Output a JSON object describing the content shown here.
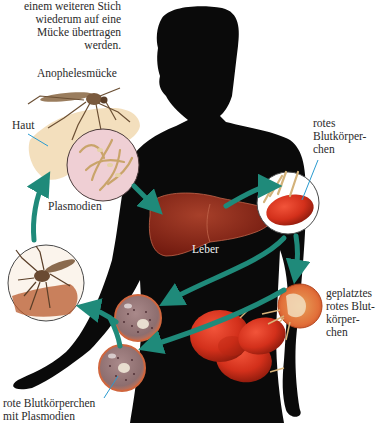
{
  "diagram": {
    "intro_text": [
      "einem weiteren Stich",
      "wiederum auf eine",
      "Mücke übertragen",
      "werden."
    ],
    "labels": {
      "mosquito": "Anophelesmücke",
      "skin": "Haut",
      "sporozoites": "Plasmodien",
      "liver": "Leber",
      "rbc": [
        "rotes",
        "Blutkörper-",
        "chen"
      ],
      "burst_rbc": [
        "geplatztes",
        "rotes Blut-",
        "körper-",
        "chen"
      ],
      "infected_rbc": [
        "rote Blutkörperchen",
        "mit Plasmodien"
      ]
    },
    "colors": {
      "silhouette": "#0a0a0a",
      "arrow": "#1f8a7a",
      "liver": "#8a2416",
      "rbc": "#d6321c",
      "infected_rbc": "#9c7a78",
      "inset_pink": "#efcfd4",
      "skin": "#f2dcb6",
      "pointer": "#2a9bd0"
    },
    "nodes": [
      {
        "id": "mosquito-bite",
        "label": "Anophelesmücke"
      },
      {
        "id": "plasmodien",
        "label": "Plasmodien"
      },
      {
        "id": "leber",
        "label": "Leber"
      },
      {
        "id": "rotes-blutkoerperchen",
        "label": "rotes Blutkörperchen"
      },
      {
        "id": "geplatztes-blutkoerperchen",
        "label": "geplatztes rotes Blutkörperchen"
      },
      {
        "id": "infizierte-blutkoerperchen",
        "label": "rote Blutkörperchen mit Plasmodien"
      },
      {
        "id": "mosquito-sucking",
        "label": ""
      }
    ],
    "edges": [
      {
        "from": "mosquito-bite",
        "to": "plasmodien"
      },
      {
        "from": "plasmodien",
        "to": "leber"
      },
      {
        "from": "leber",
        "to": "rotes-blutkoerperchen"
      },
      {
        "from": "rotes-blutkoerperchen",
        "to": "geplatztes-blutkoerperchen"
      },
      {
        "from": "rotes-blutkoerperchen",
        "to": "infizierte-blutkoerperchen"
      },
      {
        "from": "geplatztes-blutkoerperchen",
        "to": "infizierte-blutkoerperchen"
      },
      {
        "from": "infizierte-blutkoerperchen",
        "to": "mosquito-sucking"
      },
      {
        "from": "mosquito-sucking",
        "to": "mosquito-bite"
      }
    ]
  }
}
